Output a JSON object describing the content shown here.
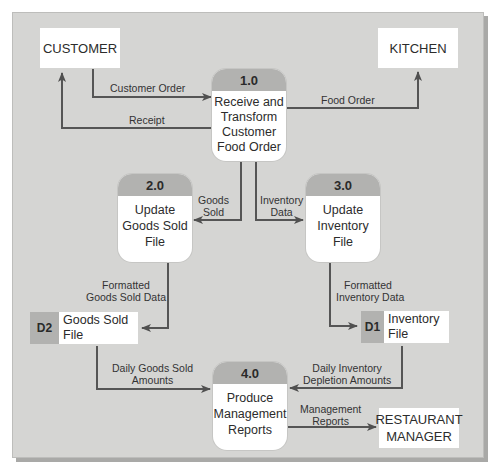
{
  "diagram": {
    "type": "data-flow-diagram",
    "external_entities": [
      {
        "id": "customer",
        "label": "CUSTOMER"
      },
      {
        "id": "kitchen",
        "label": "KITCHEN"
      },
      {
        "id": "restaurant_manager",
        "label": "RESTAURANT MANAGER"
      }
    ],
    "processes": [
      {
        "id": "1.0",
        "label": "Receive and Transform Customer Food Order"
      },
      {
        "id": "2.0",
        "label": "Update Goods Sold File"
      },
      {
        "id": "3.0",
        "label": "Update Inventory File"
      },
      {
        "id": "4.0",
        "label": "Produce Management Reports"
      }
    ],
    "data_stores": [
      {
        "id": "D1",
        "label": "Inventory File"
      },
      {
        "id": "D2",
        "label": "Goods Sold File"
      }
    ],
    "flows": [
      {
        "from": "CUSTOMER",
        "to": "1.0",
        "label": "Customer Order"
      },
      {
        "from": "1.0",
        "to": "CUSTOMER",
        "label": "Receipt"
      },
      {
        "from": "1.0",
        "to": "KITCHEN",
        "label": "Food Order"
      },
      {
        "from": "1.0",
        "to": "2.0",
        "label": "Goods Sold"
      },
      {
        "from": "1.0",
        "to": "3.0",
        "label": "Inventory Data"
      },
      {
        "from": "2.0",
        "to": "D2",
        "label": "Formatted Goods Sold Data"
      },
      {
        "from": "3.0",
        "to": "D1",
        "label": "Formatted Inventory Data"
      },
      {
        "from": "D2",
        "to": "4.0",
        "label": "Daily Goods Sold Amounts"
      },
      {
        "from": "D1",
        "to": "4.0",
        "label": "Daily Inventory Depletion Amounts"
      },
      {
        "from": "4.0",
        "to": "RESTAURANT MANAGER",
        "label": "Management Reports"
      }
    ]
  },
  "entities": {
    "customer": "CUSTOMER",
    "kitchen": "KITCHEN",
    "manager_line1": "RESTAURANT",
    "manager_line2": "MANAGER"
  },
  "processes": {
    "p1": {
      "id": "1.0",
      "l1": "Receive and",
      "l2": "Transform",
      "l3": "Customer",
      "l4": "Food Order"
    },
    "p2": {
      "id": "2.0",
      "l1": "Update",
      "l2": "Goods Sold",
      "l3": "File"
    },
    "p3": {
      "id": "3.0",
      "l1": "Update",
      "l2": "Inventory",
      "l3": "File"
    },
    "p4": {
      "id": "4.0",
      "l1": "Produce",
      "l2": "Management",
      "l3": "Reports"
    }
  },
  "stores": {
    "d1": {
      "id": "D1",
      "l1": "Inventory",
      "l2": "File"
    },
    "d2": {
      "id": "D2",
      "l1": "Goods Sold",
      "l2": "File"
    }
  },
  "flows": {
    "customer_order": "Customer Order",
    "receipt": "Receipt",
    "food_order": "Food Order",
    "goods_sold_l1": "Goods",
    "goods_sold_l2": "Sold",
    "inventory_data_l1": "Inventory",
    "inventory_data_l2": "Data",
    "fgsd_l1": "Formatted",
    "fgsd_l2": "Goods Sold Data",
    "fid_l1": "Formatted",
    "fid_l2": "Inventory Data",
    "dgsa_l1": "Daily Goods Sold",
    "dgsa_l2": "Amounts",
    "dida_l1": "Daily Inventory",
    "dida_l2": "Depletion Amounts",
    "mr_l1": "Management",
    "mr_l2": "Reports"
  },
  "colors": {
    "background": "#d5d5d3",
    "header_gray": "#b2b2b0",
    "arrow": "#555555",
    "box": "#ffffff"
  }
}
